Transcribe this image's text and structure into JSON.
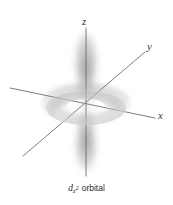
{
  "figure": {
    "background_color": "#ffffff",
    "axis_line_color": "#6e6e6e",
    "orbital_color": "#b9b9b9",
    "caption": {
      "symbol": "d",
      "subscript": "z",
      "superscript": "2",
      "word": "orbital",
      "full_text": "dz2 orbital"
    },
    "axes": [
      {
        "name": "z-axis",
        "label": "z",
        "orientation": "vertical",
        "label_x": 82,
        "label_y": 16
      },
      {
        "name": "y-axis",
        "label": "y",
        "orientation": "diagonal-up-right",
        "label_x": 147,
        "label_y": 41
      },
      {
        "name": "x-axis",
        "label": "x",
        "orientation": "diagonal-down-right",
        "label_x": 158,
        "label_y": 110
      }
    ],
    "orbital": {
      "type": "dz2",
      "parts": [
        {
          "name": "upper-lobe",
          "shape": "vertical-lobe",
          "position": "above-origin"
        },
        {
          "name": "lower-lobe",
          "shape": "vertical-lobe",
          "position": "below-origin"
        },
        {
          "name": "torus-ring",
          "shape": "ellipse-ring",
          "position": "equatorial"
        }
      ],
      "center_x": 86,
      "center_y": 105
    }
  }
}
